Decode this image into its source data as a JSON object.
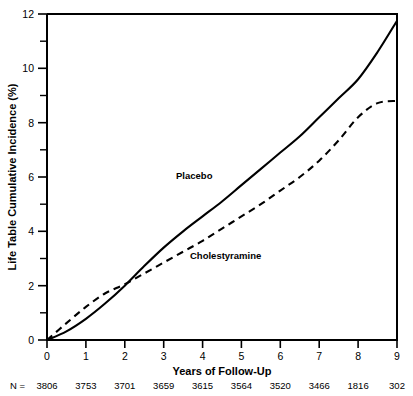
{
  "chart_data": {
    "type": "line",
    "title": "",
    "xlabel": "Years of Follow-Up",
    "ylabel": "Life Table Cumulative Incidence (%)",
    "xlim": [
      0,
      9
    ],
    "ylim": [
      0,
      12
    ],
    "grid": false,
    "legend_position": "inline-annotations",
    "x_ticks": [
      "0",
      "1",
      "2",
      "3",
      "4",
      "5",
      "6",
      "7",
      "8",
      "9"
    ],
    "y_ticks": [
      "0",
      "2",
      "4",
      "6",
      "8",
      "10",
      "12"
    ],
    "y_minor_ticks": [
      1,
      3,
      5,
      7,
      9,
      11
    ],
    "x": [
      0,
      0.5,
      1,
      1.5,
      2,
      2.5,
      3,
      3.5,
      4,
      4.5,
      5,
      5.5,
      6,
      6.5,
      7,
      7.5,
      8,
      8.5,
      9
    ],
    "series": [
      {
        "name": "Placebo",
        "style": "solid",
        "label_annotation": "Placebo",
        "values": [
          0,
          0.32,
          0.78,
          1.35,
          2.0,
          2.72,
          3.4,
          4.0,
          4.55,
          5.1,
          5.7,
          6.3,
          6.9,
          7.5,
          8.2,
          8.9,
          9.6,
          10.6,
          11.75
        ]
      },
      {
        "name": "Cholestyramine",
        "style": "dashed",
        "label_annotation": "Cholestyramine",
        "values": [
          0,
          0.62,
          1.22,
          1.72,
          2.05,
          2.45,
          2.85,
          3.25,
          3.65,
          4.1,
          4.55,
          5.0,
          5.5,
          6.0,
          6.6,
          7.35,
          8.2,
          8.72,
          8.8
        ]
      }
    ],
    "annotations": [
      {
        "text": "Placebo",
        "x_px": 176,
        "y_px": 179
      },
      {
        "text": "Cholestyramine",
        "x_px": 190,
        "y_px": 259
      }
    ],
    "footer_row": {
      "prefix": "N =",
      "values": [
        "3806",
        "3753",
        "3701",
        "3659",
        "3615",
        "3564",
        "3520",
        "3466",
        "1816",
        "302"
      ]
    }
  }
}
